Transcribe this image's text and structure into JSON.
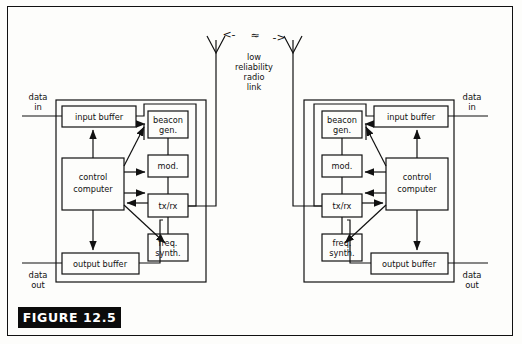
{
  "figure": {
    "caption": "FIGURE 12.5",
    "link_label_lines": [
      "low",
      "reliability",
      "radio",
      "link"
    ],
    "link_arrow_left": "<-",
    "link_arrow_right": "->",
    "link_wave": "≈"
  },
  "stations": [
    {
      "side": "left",
      "data_in_lines": [
        "data",
        "in"
      ],
      "data_out_lines": [
        "data",
        "out"
      ],
      "blocks": {
        "input_buffer": "input buffer",
        "output_buffer": "output buffer",
        "control_computer_lines": [
          "control",
          "computer"
        ],
        "beacon_gen_lines": [
          "beacon",
          "gen."
        ],
        "mod": "mod.",
        "txrx": "tx/rx",
        "freq_synth_lines": [
          "freq.",
          "synth."
        ]
      }
    },
    {
      "side": "right",
      "data_in_lines": [
        "data",
        "in"
      ],
      "data_out_lines": [
        "data",
        "out"
      ],
      "blocks": {
        "input_buffer": "input buffer",
        "output_buffer": "output buffer",
        "control_computer_lines": [
          "control",
          "computer"
        ],
        "beacon_gen_lines": [
          "beacon",
          "gen."
        ],
        "mod": "mod.",
        "txrx": "tx/rx",
        "freq_synth_lines": [
          "freq.",
          "synth."
        ]
      }
    }
  ],
  "colors": {
    "ink": "#111111",
    "paper": "#fdfdfb",
    "caption_bg": "#0b0b0b",
    "caption_fg": "#ffffff"
  }
}
